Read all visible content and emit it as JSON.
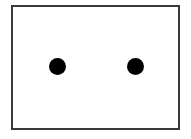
{
  "figure": {
    "title": "",
    "caption": "",
    "background_color": "#ffffff",
    "frame": {
      "name": "rectangle-border",
      "stroke_color": "#3a3a3a",
      "stroke_width_px": 2,
      "fill_color": "#ffffff",
      "x": 11,
      "y": 5,
      "width": 169,
      "height": 125
    },
    "marks": [
      {
        "name": "dot-left",
        "shape": "circle",
        "fill_color": "#000000",
        "center_x": 57,
        "center_y": 66,
        "diameter_px": 17,
        "label": ""
      },
      {
        "name": "dot-right",
        "shape": "circle",
        "fill_color": "#000000",
        "center_x": 135,
        "center_y": 66,
        "diameter_px": 17,
        "label": ""
      }
    ],
    "mark_count": "2",
    "description": "Two solid black dots inside a thin rectangular outline"
  }
}
